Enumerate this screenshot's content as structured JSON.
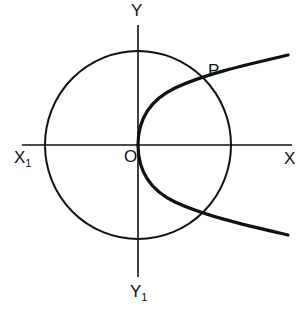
{
  "diagram": {
    "colors": {
      "stroke": "#111111",
      "background": "#ffffff"
    },
    "axes": {
      "x_positive_label": "X",
      "x_negative_label": "X",
      "x_negative_subscript": "1",
      "y_positive_label": "Y",
      "y_negative_label": "Y",
      "y_negative_subscript": "1",
      "origin_label": "O"
    },
    "circle": {
      "center": "O"
    },
    "parabola": {
      "vertex": "O",
      "opens": "right"
    },
    "points": [
      {
        "label": "P",
        "description": "intersection of parabola (upper branch) and circle"
      }
    ]
  }
}
